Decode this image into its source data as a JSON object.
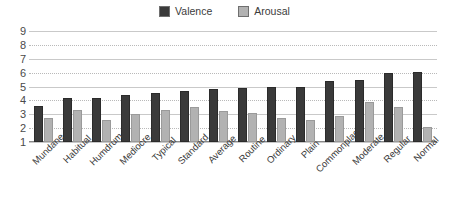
{
  "chart_data": {
    "type": "bar",
    "title": "",
    "xlabel": "",
    "ylabel": "",
    "ylim": [
      1,
      9
    ],
    "yticks": [
      9,
      8,
      7,
      6,
      5,
      4,
      3,
      2,
      1
    ],
    "grid": true,
    "legend_position": "top-center",
    "categories": [
      "Mundane",
      "Habitual",
      "Humdrum",
      "Mediocre",
      "Typical",
      "Standard",
      "Average",
      "Routine",
      "Ordinary",
      "Plain",
      "Commonplace",
      "Moderate",
      "Regular",
      "Normal"
    ],
    "series": [
      {
        "name": "Valence",
        "color": "#3a3a3a",
        "values": [
          3.6,
          4.2,
          4.2,
          4.4,
          4.5,
          4.7,
          4.85,
          4.9,
          5.0,
          5.0,
          5.4,
          5.45,
          6.0,
          6.05
        ]
      },
      {
        "name": "Arousal",
        "color": "#b2b2b2",
        "values": [
          2.7,
          3.3,
          2.6,
          3.0,
          3.3,
          3.55,
          3.2,
          3.1,
          2.75,
          2.6,
          2.9,
          3.9,
          3.5,
          2.1
        ]
      }
    ]
  }
}
